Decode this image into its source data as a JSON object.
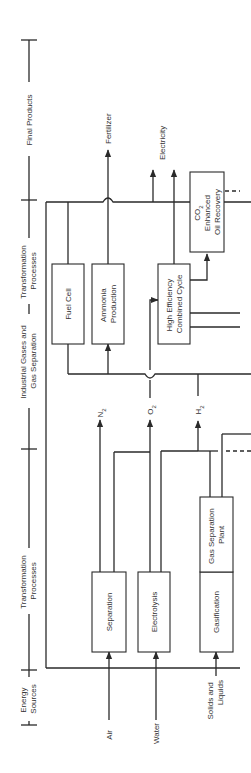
{
  "diagram": {
    "orientation": "rotated-90-ccw",
    "stages": [
      {
        "label_lines": [
          "Energy",
          "Sources"
        ]
      },
      {
        "label_lines": [
          "Transformation",
          "Processes"
        ]
      },
      {
        "label_lines": [
          "Industrial Gases and",
          "Gas Separation"
        ]
      },
      {
        "label_lines": [
          "Transformation",
          "Processes"
        ]
      },
      {
        "label_lines": [
          "Final Products"
        ]
      }
    ],
    "inputs": [
      {
        "label_lines": [
          "Air"
        ]
      },
      {
        "label_lines": [
          "Water"
        ]
      },
      {
        "label_lines": [
          "Solids and",
          "Liquids"
        ]
      }
    ],
    "process_boxes_stage1": [
      {
        "label_lines": [
          "Separation"
        ]
      },
      {
        "label_lines": [
          "Electrolysis"
        ]
      },
      {
        "label_lines": [
          "Gasification"
        ]
      },
      {
        "label_lines": [
          "Gas Separation",
          "Plant"
        ]
      }
    ],
    "gases": [
      {
        "symbol": "N",
        "subscript": "2"
      },
      {
        "symbol": "O",
        "subscript": "2"
      },
      {
        "symbol": "H",
        "subscript": "2"
      }
    ],
    "process_boxes_stage2": [
      {
        "label_lines": [
          "Fuel Cell"
        ]
      },
      {
        "label_lines": [
          "Ammonia",
          "Production"
        ]
      },
      {
        "label_lines": [
          "High Efficiency",
          "Combined Cycle"
        ]
      },
      {
        "label_lines": [
          "CO",
          "2",
          "Enhanced",
          "Oil Recovery"
        ]
      }
    ],
    "final_products": [
      {
        "label_lines": [
          "Fertilizer"
        ]
      },
      {
        "label_lines": [
          "Electricity"
        ]
      }
    ],
    "colors": {
      "line": "#2a2a2a",
      "text": "#333333",
      "background": "#ffffff"
    }
  }
}
